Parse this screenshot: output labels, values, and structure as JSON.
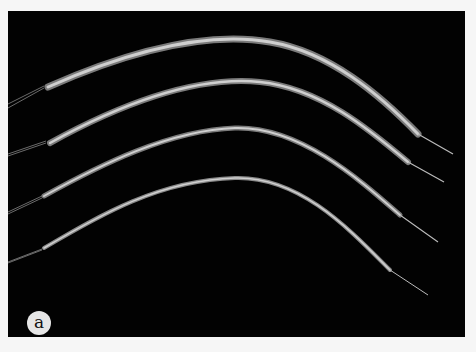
{
  "figure": {
    "panel_label": "a",
    "background_color": "#020202",
    "fiber_color": "#bdbdbd",
    "label_bg_color": "#e6e6e6",
    "fibers": [
      {
        "id": 1,
        "start": [
          145,
          88
        ],
        "end": [
          455,
          401
        ]
      },
      {
        "id": 2,
        "start": [
          145,
          147
        ],
        "end": [
          445,
          477
        ]
      },
      {
        "id": 3,
        "start": [
          130,
          205
        ],
        "end": [
          435,
          540
        ]
      },
      {
        "id": 4,
        "start": [
          130,
          250
        ],
        "end": [
          425,
          597
        ]
      }
    ]
  }
}
